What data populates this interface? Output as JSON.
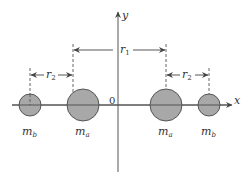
{
  "diagram": {
    "type": "physics-mass-distribution",
    "axes": {
      "x_label": "x",
      "y_label": "y",
      "origin_label": "0"
    },
    "masses": [
      {
        "id": "mb-left",
        "label": "m",
        "subscript": "b",
        "cx": 30,
        "r": 11
      },
      {
        "id": "ma-left",
        "label": "m",
        "subscript": "a",
        "cx": 83,
        "r": 16
      },
      {
        "id": "ma-right",
        "label": "m",
        "subscript": "a",
        "cx": 166,
        "r": 16
      },
      {
        "id": "mb-right",
        "label": "m",
        "subscript": "b",
        "cx": 209,
        "r": 11
      }
    ],
    "dimensions": {
      "r1": {
        "label": "r",
        "subscript": "1"
      },
      "r2_left": {
        "label": "r",
        "subscript": "2"
      },
      "r2_right": {
        "label": "r",
        "subscript": "2"
      }
    },
    "colors": {
      "mass_fill": "#a8a8a8",
      "mass_stroke": "#555555",
      "line": "#444444"
    }
  }
}
